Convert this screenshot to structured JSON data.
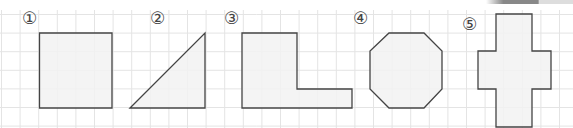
{
  "worksheet": {
    "grid": {
      "pitch": 18.6,
      "origin_x": 1.5,
      "origin_y": 14.5,
      "line_color": "#e4e4e4"
    },
    "shape_fill": "#f2f2f2",
    "shape_stroke": "#444444",
    "figures": [
      {
        "id": 1,
        "label": "①",
        "name": "square",
        "label_x": 22,
        "label_y": 10,
        "points": "39.5,33 112,33 112,108 39.5,108"
      },
      {
        "id": 2,
        "label": "②",
        "name": "right-triangle",
        "label_x": 150,
        "label_y": 10,
        "points": "130,108 205,33 205,108"
      },
      {
        "id": 3,
        "label": "③",
        "name": "l-shape",
        "label_x": 224,
        "label_y": 10,
        "points": "242,33 297,33 297,89 352,89 352,108 242,108"
      },
      {
        "id": 4,
        "label": "④",
        "name": "octagon",
        "label_x": 353,
        "label_y": 10,
        "points": "389,33 424,33 442,51 442,89 424,108 389,108 370,89 370,51"
      },
      {
        "id": 5,
        "label": "⑤",
        "name": "cross",
        "label_x": 462,
        "label_y": 16,
        "points": "496,14 532,14 532,51 551,51 551,89 532,89 532,127 496,127 496,89 478,89 478,51 496,51"
      }
    ]
  },
  "decoration": {
    "tab_color": "#888888"
  }
}
